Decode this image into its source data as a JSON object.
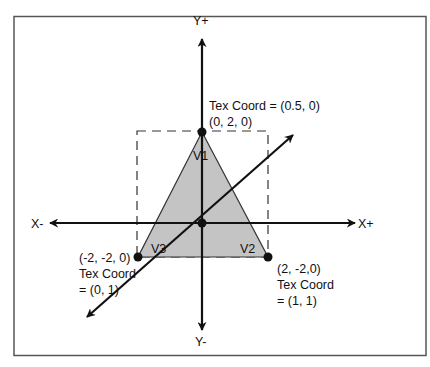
{
  "diagram": {
    "type": "triangle-texture-coordinates",
    "colors": {
      "frame": "#555555",
      "axis": "#111111",
      "triangle_fill": "#c4c4c4",
      "triangle_stroke": "#333333",
      "dashed_box": "#333333",
      "text": "#111111"
    },
    "axes": {
      "y_pos": "Y+",
      "y_neg": "Y-",
      "x_pos": "X+",
      "x_neg": "X-"
    },
    "vertices": [
      {
        "name": "V1",
        "position": "(0, 2, 0)",
        "tex_coord_line1": "Tex Coord = (0.5, 0)",
        "tex_coord_line2": ""
      },
      {
        "name": "V2",
        "position": "(2, -2,0)",
        "tex_coord_line1": "Tex Coord",
        "tex_coord_line2": "= (1, 1)"
      },
      {
        "name": "V3",
        "position": "(-2, -2, 0)",
        "tex_coord_line1": "Tex Coord",
        "tex_coord_line2": "= (0, 1)"
      }
    ]
  }
}
